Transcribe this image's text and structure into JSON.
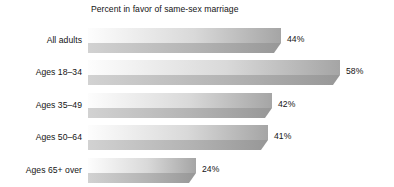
{
  "chart_data": {
    "type": "bar",
    "orientation": "horizontal",
    "title": "Percent in favor of same-sex marriage",
    "xlabel": "",
    "ylabel": "",
    "categories": [
      "All adults",
      "Ages 18–34",
      "Ages 35–49",
      "Ages 50–64",
      "Ages 65+ over"
    ],
    "values": [
      44,
      58,
      42,
      41,
      24
    ],
    "value_labels": [
      "44%",
      "58%",
      "42%",
      "41%",
      "24%"
    ],
    "unit": "%",
    "xlim": [
      0,
      58
    ],
    "grid": false,
    "legend": null,
    "style": {
      "bar_fill_light": "#fbfbfb",
      "bar_fill_dark": "#a8a8a8",
      "bar_front_light": "#c8c8c8",
      "bar_front_dark": "#9a9a9a",
      "bar_edge": "#8c8c8c",
      "background": "#ffffff",
      "text": "#141414"
    }
  }
}
